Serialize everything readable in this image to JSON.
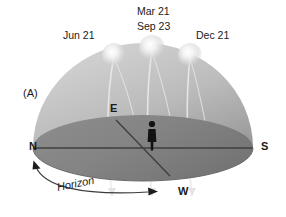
{
  "figure": {
    "panel_label": "(A)",
    "title_present": false
  },
  "sun_labels": [
    {
      "name": "jun-solstice",
      "text": "Jun 21",
      "x": 63,
      "y": 30
    },
    {
      "name": "mar-sep-equinox-1",
      "text": "Mar 21",
      "x": 137,
      "y": 6
    },
    {
      "name": "mar-sep-equinox-2",
      "text": "Sep 23",
      "x": 137,
      "y": 21
    },
    {
      "name": "dec-solstice",
      "text": "Dec 21",
      "x": 196,
      "y": 30
    }
  ],
  "cardinal_points": [
    {
      "name": "north",
      "text": "N",
      "x": 29,
      "y": 148
    },
    {
      "name": "south",
      "text": "S",
      "x": 261,
      "y": 148
    },
    {
      "name": "east",
      "text": "E",
      "x": 110,
      "y": 109
    },
    {
      "name": "west",
      "text": "W",
      "x": 178,
      "y": 190
    }
  ],
  "horizon": {
    "label": "Horizon"
  },
  "suns": [
    {
      "name": "sun-jun-21",
      "cx": 114,
      "cy": 55,
      "r": 10.5
    },
    {
      "name": "sun-equinox",
      "cx": 152,
      "cy": 48,
      "r": 11.5
    },
    {
      "name": "sun-dec-21",
      "cx": 190,
      "cy": 55,
      "r": 10.5
    }
  ],
  "colors": {
    "dome_light": "#cfcfcf",
    "dome_mid": "#b9b9b9",
    "dome_dark": "#9b9b9b",
    "ground_light": "#8e8e8e",
    "ground_dark": "#7a7a7a",
    "outline": "#4a4a4a",
    "arc": "#e9e9e9",
    "figure_black": "#111111",
    "text": "#1a1a1a",
    "background": "#ffffff"
  },
  "observer": {
    "name": "observer-figure",
    "x": 152,
    "y": 128
  }
}
